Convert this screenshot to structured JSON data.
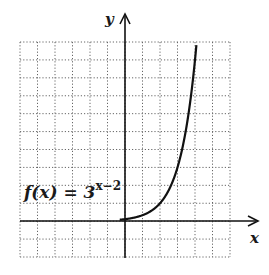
{
  "chart_data": {
    "type": "line",
    "title": "",
    "xlabel": "x",
    "ylabel": "y",
    "function_label": {
      "base": "f(x) = 3",
      "exponent": "x−2"
    },
    "equation": "f(x) = 3^(x-2)",
    "xlim": [
      -6,
      6
    ],
    "ylim": [
      -2,
      10
    ],
    "grid": true,
    "grid_style": "dotted",
    "tick_labels": "none",
    "series": [
      {
        "name": "f(x) = 3^(x-2)",
        "x": [
          -6,
          -4,
          -2,
          0,
          1,
          2,
          3,
          3.5,
          4,
          4.1
        ],
        "y": [
          0.0002,
          0.0014,
          0.012,
          0.111,
          0.333,
          1,
          3,
          5.196,
          9,
          9.87
        ]
      }
    ],
    "colors": {
      "curve": "#111111",
      "axes": "#111111",
      "grid": "#555555"
    }
  }
}
